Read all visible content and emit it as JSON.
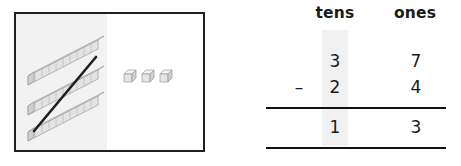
{
  "model": {
    "left_section_label": "tens",
    "right_section_label": "ones",
    "tens_rods_count": 3,
    "rod_unit_segments": 10,
    "ones_cubes_count": 3,
    "crossed_out": true,
    "crossed_out_group": "tens",
    "block_face_color": "#e8e8e8",
    "block_top_color": "#f4f4f4",
    "block_side_color": "#cfcfcf",
    "block_outline_color": "#9a9a9a",
    "strike_color": "#231f20",
    "panel_border_color": "#231f20",
    "tens_half_fill": "#f2f2f2",
    "ones_half_fill": "#ffffff"
  },
  "place_value": {
    "headers": {
      "tens": "tens",
      "ones": "ones"
    },
    "minuend": {
      "tens": "3",
      "ones": "7"
    },
    "subtrahend": {
      "tens": "2",
      "ones": "4"
    },
    "operator": "–",
    "difference": {
      "tens": "1",
      "ones": "3"
    },
    "highlight_column": "tens",
    "highlight_color": "#f1f1f1",
    "rule_color": "#111111",
    "text_color": "#1b1b1b"
  }
}
